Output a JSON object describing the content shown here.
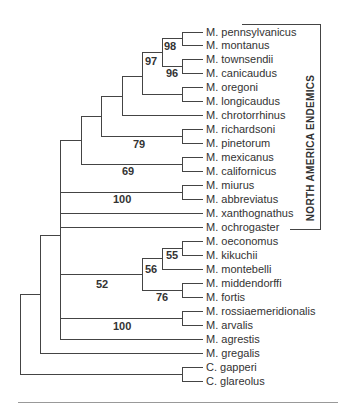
{
  "bracket": {
    "label": "NORTH AMERICA ENDEMICS"
  },
  "taxa": [
    "M. pennsylvanicus",
    "M. montanus",
    "M. townsendii",
    "M. canicaudus",
    "M. oregoni",
    "M. longicaudus",
    "M. chrotorrhinus",
    "M. richardsoni",
    "M. pinetorum",
    "M. mexicanus",
    "M. californicus",
    "M. miurus",
    "M. abbreviatus",
    "M. xanthognathus",
    "M. ochrogaster",
    "M. oeconomus",
    "M. kikuchii",
    "M. montebelli",
    "M. middendorffi",
    "M. fortis",
    "M. rossiaemeridionalis",
    "M. arvalis",
    "M. agrestis",
    "M. gregalis",
    "C. gapperi",
    "C. glareolus"
  ],
  "bootstrap": [
    {
      "value": "98",
      "x": 164,
      "y": 40
    },
    {
      "value": "97",
      "x": 145,
      "y": 55
    },
    {
      "value": "96",
      "x": 166,
      "y": 67
    },
    {
      "value": "79",
      "x": 133,
      "y": 138
    },
    {
      "value": "69",
      "x": 122,
      "y": 165
    },
    {
      "value": "100",
      "x": 113,
      "y": 193
    },
    {
      "value": "55",
      "x": 166,
      "y": 249
    },
    {
      "value": "56",
      "x": 145,
      "y": 263
    },
    {
      "value": "52",
      "x": 96,
      "y": 278
    },
    {
      "value": "76",
      "x": 156,
      "y": 291
    },
    {
      "value": "100",
      "x": 113,
      "y": 320
    }
  ]
}
